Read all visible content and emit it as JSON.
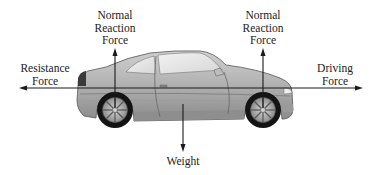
{
  "diagram": {
    "colors": {
      "arrow": "#1a1a1a",
      "text": "#222222",
      "body_light": "#d4d4d4",
      "body_mid": "#a6a6a6",
      "body_dark": "#6e6e6e",
      "tyre": "#111111",
      "rim": "#9a9a9a",
      "glass": "#e8e8e8"
    },
    "forces": [
      {
        "id": "normal-rear",
        "lines": [
          "Normal",
          "Reaction",
          "Force"
        ],
        "direction": "up"
      },
      {
        "id": "normal-front",
        "lines": [
          "Normal",
          "Reaction",
          "Force"
        ],
        "direction": "up"
      },
      {
        "id": "resistance",
        "lines": [
          "Resistance",
          "Force"
        ],
        "direction": "left"
      },
      {
        "id": "driving",
        "lines": [
          "Driving",
          "Force"
        ],
        "direction": "right"
      },
      {
        "id": "weight",
        "lines": [
          "Weight"
        ],
        "direction": "down"
      }
    ]
  }
}
